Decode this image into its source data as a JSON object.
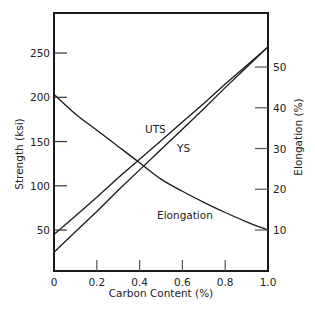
{
  "chart_data": {
    "type": "line",
    "title": "",
    "xlabel": "Carbon Content (%)",
    "ylabel": "Strength (ksi)",
    "y2label": "Elongation (%)",
    "xlim": [
      0,
      1.0
    ],
    "ylim": [
      3,
      295
    ],
    "y2lim": [
      0.6,
      62
    ],
    "grid": false,
    "legend": "inline labels",
    "x_ticks": [
      "0",
      "0.2",
      "0.4",
      "0.6",
      "0.8",
      "1.0"
    ],
    "y_ticks": [
      "50",
      "100",
      "150",
      "200",
      "250"
    ],
    "y2_ticks": [
      "10",
      "20",
      "30",
      "40",
      "50"
    ],
    "x": [
      0,
      0.1,
      0.2,
      0.3,
      0.4,
      0.5,
      0.6,
      0.7,
      0.8,
      0.9,
      1.0
    ],
    "series": [
      {
        "name": "UTS",
        "axis": "left",
        "values": [
          45,
          66,
          87,
          109,
          130,
          151,
          172,
          193,
          215,
          236,
          257
        ]
      },
      {
        "name": "YS",
        "axis": "left",
        "values": [
          25,
          48,
          71,
          95,
          118,
          141,
          164,
          187,
          211,
          234,
          257
        ]
      },
      {
        "name": "Elongation",
        "axis": "right",
        "values": [
          43.3,
          38.5,
          34.5,
          30.5,
          26.5,
          22.5,
          19.5,
          16.8,
          14.3,
          12.0,
          10.0
        ]
      }
    ],
    "annotations": [
      {
        "text": "UTS",
        "x": 0.37,
        "y_ksi": 160
      },
      {
        "text": "YS",
        "x": 0.5,
        "y_ksi": 148
      },
      {
        "text": "Elongation",
        "x": 0.52,
        "y2_pct": 15
      }
    ]
  }
}
